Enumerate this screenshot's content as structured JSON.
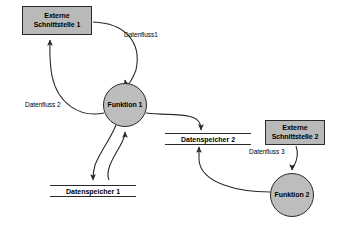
{
  "diagram": {
    "canvas": {
      "width": 346,
      "height": 230
    },
    "colors": {
      "node_fill": "#b9b9b9",
      "process_fill": "#bdbdbd",
      "stroke": "#2a2a2a",
      "background": "#ffffff",
      "text": "#000000"
    },
    "nodes": [
      {
        "id": "ext1",
        "type": "external-entity",
        "label": "Externe\nSchnittstelle 1",
        "line1": "Externe",
        "line2": "Schnittstelle 1",
        "x": 22,
        "y": 6,
        "w": 70,
        "h": 29
      },
      {
        "id": "func1",
        "type": "process",
        "label": "Funktion 1",
        "cx": 125,
        "cy": 105,
        "r": 22
      },
      {
        "id": "ext2",
        "type": "external-entity",
        "label": "Externe\nSchnittstelle 2",
        "line1": "Externe",
        "line2": "Schnittstelle 2",
        "x": 265,
        "y": 120,
        "w": 60,
        "h": 25
      },
      {
        "id": "func2",
        "type": "process",
        "label": "Funktion 2",
        "cx": 292,
        "cy": 195,
        "r": 22
      },
      {
        "id": "store1",
        "type": "data-store",
        "label": "Datenspeicher 1",
        "x": 50,
        "y": 185,
        "w": 86
      },
      {
        "id": "store2",
        "type": "data-store",
        "label": "Datenspeicher 2",
        "x": 165,
        "y": 133,
        "w": 86
      }
    ],
    "flows": [
      {
        "id": "flow1",
        "label": "Datenfluss1",
        "from": "ext1",
        "to": "func1",
        "label_x": 124,
        "label_y": 31
      },
      {
        "id": "flow2",
        "label": "Datenfluss 2",
        "from": "func1",
        "to": "ext1",
        "label_x": 25,
        "label_y": 101
      },
      {
        "id": "flow3",
        "label": "",
        "from": "func1",
        "to": "store1",
        "label_x": 0,
        "label_y": 0
      },
      {
        "id": "flow4",
        "label": "",
        "from": "store1",
        "to": "func1",
        "label_x": 0,
        "label_y": 0
      },
      {
        "id": "flow5",
        "label": "",
        "from": "func1",
        "to": "store2",
        "label_x": 0,
        "label_y": 0
      },
      {
        "id": "flow6",
        "label": "",
        "from": "func2",
        "to": "store2",
        "label_x": 0,
        "label_y": 0
      },
      {
        "id": "flow7",
        "label": "Datenfluss 3",
        "from": "ext2",
        "to": "func2",
        "label_x": 249,
        "label_y": 148
      }
    ]
  }
}
